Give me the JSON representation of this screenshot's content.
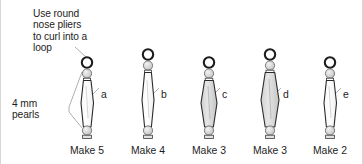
{
  "figure": {
    "title_note": "Use round\nnose pliers\nto curl into a\nloop",
    "pearls_note": "4 mm\npearls",
    "background_color": "#ffffff",
    "ink_color": "#1d1d1d",
    "bead_fill_light": "#ffffff",
    "bead_fill_shaded": "#dcdcdc",
    "pearl_fill": "#d5d5d5",
    "leader_line_color": "#9a9a9a"
  },
  "columns": [
    {
      "letter": "a",
      "make_label": "Make 5",
      "center_x": 87,
      "bead_width": 13,
      "bead_shading": "light",
      "loop_top_y": 57
    },
    {
      "letter": "b",
      "make_label": "Make 4",
      "center_x": 148,
      "bead_width": 12,
      "bead_shading": "light",
      "loop_top_y": 49
    },
    {
      "letter": "c",
      "make_label": "Make 3",
      "center_x": 209,
      "bead_width": 16,
      "bead_shading": "shaded",
      "loop_top_y": 57
    },
    {
      "letter": "d",
      "make_label": "Make 3",
      "center_x": 270,
      "bead_width": 18,
      "bead_shading": "shaded",
      "loop_top_y": 49
    },
    {
      "letter": "e",
      "make_label": "Make 2",
      "center_x": 330,
      "bead_width": 13,
      "bead_shading": "light",
      "loop_top_y": 57
    }
  ],
  "letters": [
    {
      "label": "a",
      "x": 101,
      "y": 89
    },
    {
      "label": "b",
      "x": 161,
      "y": 89
    },
    {
      "label": "c",
      "x": 222,
      "y": 89
    },
    {
      "label": "d",
      "x": 283,
      "y": 89
    },
    {
      "label": "e",
      "x": 343,
      "y": 89
    }
  ],
  "make_labels": [
    {
      "label": "Make 5",
      "x": 56
    },
    {
      "label": "Make 4",
      "x": 117
    },
    {
      "label": "Make 3",
      "x": 178
    },
    {
      "label": "Make 3",
      "x": 239
    },
    {
      "label": "Make 2",
      "x": 299
    }
  ]
}
